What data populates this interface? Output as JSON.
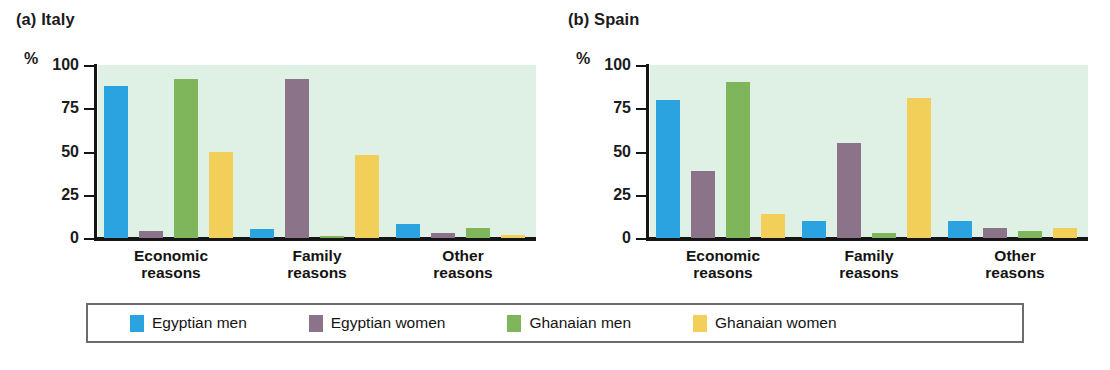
{
  "chart_data": {
    "type": "bar",
    "title": "",
    "panels": [
      {
        "tag": "(a)",
        "name": "Italy",
        "label": "(a) Italy",
        "categories": [
          "Economic reasons",
          "Family reasons",
          "Other reasons"
        ],
        "series": [
          {
            "name": "Egyptian men",
            "color": "#2AA3E0",
            "values": [
              88,
              5,
              8
            ]
          },
          {
            "name": "Egyptian women",
            "color": "#8B7389",
            "values": [
              4,
              92,
              3
            ]
          },
          {
            "name": "Ghanaian men",
            "color": "#7FB55B",
            "values": [
              92,
              1,
              6
            ]
          },
          {
            "name": "Ghanaian women",
            "color": "#F2CF59",
            "values": [
              50,
              48,
              2
            ]
          }
        ]
      },
      {
        "tag": "(b)",
        "name": "Spain",
        "label": "(b) Spain",
        "categories": [
          "Economic reasons",
          "Family reasons",
          "Other reasons"
        ],
        "series": [
          {
            "name": "Egyptian men",
            "color": "#2AA3E0",
            "values": [
              80,
              10,
              10
            ]
          },
          {
            "name": "Egyptian women",
            "color": "#8B7389",
            "values": [
              39,
              55,
              6
            ]
          },
          {
            "name": "Ghanaian men",
            "color": "#7FB55B",
            "values": [
              90,
              3,
              4
            ]
          },
          {
            "name": "Ghanaian women",
            "color": "#F2CF59",
            "values": [
              14,
              81,
              6
            ]
          }
        ]
      }
    ],
    "ylabel": "%",
    "xlabel": "",
    "ylim": [
      0,
      100
    ],
    "yticks": [
      100,
      75,
      50,
      25,
      0
    ],
    "ytick_labels": [
      "100",
      "75",
      "50",
      "25",
      "0"
    ],
    "grid": false,
    "legend_position": "bottom",
    "legend": [
      "Egyptian men",
      "Egyptian women",
      "Ghanaian men",
      "Ghanaian women"
    ],
    "category_lines": [
      [
        "Economic",
        "reasons"
      ],
      [
        "Family",
        "reasons"
      ],
      [
        "Other",
        "reasons"
      ]
    ],
    "plot_background": "#DFF0E5"
  }
}
